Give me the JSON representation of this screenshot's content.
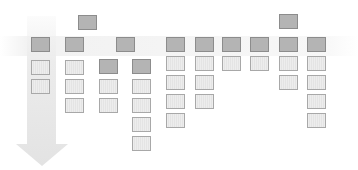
{
  "diagram": {
    "arrow": {
      "direction": "down",
      "color": "#e6e6e6"
    },
    "colors": {
      "dark_fill": "#b4b4b4",
      "dark_border": "#8c8c8c",
      "light_fill": "#ececec",
      "light_border": "#a8a8a8"
    },
    "blocks": [
      {
        "x": 78,
        "y": 15,
        "type": "dark"
      },
      {
        "x": 31,
        "y": 37,
        "type": "dark"
      },
      {
        "x": 31,
        "y": 60,
        "type": "light"
      },
      {
        "x": 31,
        "y": 79,
        "type": "light"
      },
      {
        "x": 65,
        "y": 37,
        "type": "dark"
      },
      {
        "x": 65,
        "y": 60,
        "type": "light"
      },
      {
        "x": 65,
        "y": 79,
        "type": "light"
      },
      {
        "x": 65,
        "y": 98,
        "type": "light"
      },
      {
        "x": 116,
        "y": 37,
        "type": "dark"
      },
      {
        "x": 99,
        "y": 59,
        "type": "dark"
      },
      {
        "x": 99,
        "y": 79,
        "type": "light"
      },
      {
        "x": 99,
        "y": 98,
        "type": "light"
      },
      {
        "x": 132,
        "y": 59,
        "type": "dark"
      },
      {
        "x": 132,
        "y": 79,
        "type": "light"
      },
      {
        "x": 132,
        "y": 98,
        "type": "light"
      },
      {
        "x": 132,
        "y": 117,
        "type": "light"
      },
      {
        "x": 132,
        "y": 136,
        "type": "light"
      },
      {
        "x": 166,
        "y": 37,
        "type": "dark"
      },
      {
        "x": 166,
        "y": 56,
        "type": "light"
      },
      {
        "x": 166,
        "y": 75,
        "type": "light"
      },
      {
        "x": 166,
        "y": 94,
        "type": "light"
      },
      {
        "x": 166,
        "y": 113,
        "type": "light"
      },
      {
        "x": 195,
        "y": 37,
        "type": "dark"
      },
      {
        "x": 195,
        "y": 56,
        "type": "light"
      },
      {
        "x": 195,
        "y": 75,
        "type": "light"
      },
      {
        "x": 195,
        "y": 94,
        "type": "light"
      },
      {
        "x": 222,
        "y": 37,
        "type": "dark"
      },
      {
        "x": 222,
        "y": 56,
        "type": "light"
      },
      {
        "x": 250,
        "y": 37,
        "type": "dark"
      },
      {
        "x": 250,
        "y": 56,
        "type": "light"
      },
      {
        "x": 279,
        "y": 14,
        "type": "dark"
      },
      {
        "x": 279,
        "y": 37,
        "type": "dark"
      },
      {
        "x": 279,
        "y": 56,
        "type": "light"
      },
      {
        "x": 279,
        "y": 75,
        "type": "light"
      },
      {
        "x": 307,
        "y": 37,
        "type": "dark"
      },
      {
        "x": 307,
        "y": 56,
        "type": "light"
      },
      {
        "x": 307,
        "y": 75,
        "type": "light"
      },
      {
        "x": 307,
        "y": 94,
        "type": "light"
      },
      {
        "x": 307,
        "y": 113,
        "type": "light"
      }
    ]
  }
}
